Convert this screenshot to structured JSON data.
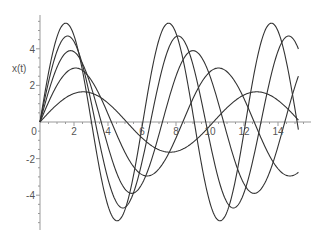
{
  "chart_data": {
    "type": "line",
    "title": "",
    "xlabel": "",
    "ylabel": "x(t)",
    "xlim": [
      0,
      15.5
    ],
    "ylim": [
      -5.9,
      5.8
    ],
    "grid": false,
    "legend": null,
    "xticks": [
      0,
      2,
      4,
      6,
      8,
      10,
      12,
      14
    ],
    "xtick_labels": [
      "0",
      "2",
      "4",
      "6",
      "8",
      "10",
      "12",
      "14"
    ],
    "yticks": [
      -4,
      -2,
      2,
      4
    ],
    "ytick_labels": [
      "-4",
      "-2",
      "2",
      "4"
    ],
    "x": [
      0,
      0.5,
      1,
      1.5,
      2,
      2.5,
      3,
      3.5,
      4,
      4.5,
      5,
      5.5,
      6,
      6.5,
      7,
      7.5,
      8,
      8.5,
      9,
      9.5,
      10,
      10.5,
      11,
      11.5,
      12,
      12.5,
      13,
      13.5,
      14,
      14.5,
      15,
      15.2
    ],
    "series": [
      {
        "name": "curve-1",
        "amplitude": 5.4,
        "period": 6.05,
        "values": [
          0,
          2.64,
          4.67,
          5.4,
          4.78,
          3.08,
          0.55,
          -2.09,
          -4.3,
          -5.33,
          -5.03,
          -3.45,
          -0.96,
          1.66,
          3.96,
          5.19,
          5.22,
          3.99,
          1.55,
          -1.09,
          -3.52,
          -4.98,
          -5.31,
          -4.28,
          -1.95,
          0.65,
          3.14,
          4.88,
          5.4,
          4.73,
          2.74,
          1.63
        ]
      },
      {
        "name": "curve-2",
        "amplitude": 4.7,
        "period": 6.5,
        "values": [
          0,
          2.13,
          3.79,
          4.67,
          4.31,
          2.96,
          0.98,
          -1.27,
          -3.2,
          -4.47,
          -4.66,
          -3.7,
          -1.79,
          0.5,
          2.56,
          4.07,
          4.67,
          4.2,
          2.81,
          0.73,
          -1.52,
          -3.4,
          -4.55,
          -4.64,
          -3.58,
          -1.56,
          0.73,
          2.84,
          4.23,
          4.66,
          4.08,
          3.49
        ]
      },
      {
        "name": "curve-3",
        "amplitude": 3.9,
        "period": 7.2,
        "values": [
          0,
          1.65,
          3.0,
          3.79,
          3.84,
          3.14,
          1.89,
          0.34,
          -1.35,
          -2.76,
          -3.66,
          -3.88,
          -3.38,
          -2.21,
          -0.68,
          0.98,
          2.47,
          3.5,
          3.9,
          3.58,
          2.5,
          1.03,
          -0.68,
          -2.19,
          -3.32,
          -3.85,
          -3.71,
          -2.94,
          -1.55,
          0.1,
          1.78,
          2.46
        ]
      },
      {
        "name": "curve-4",
        "amplitude": 2.95,
        "period": 8.4,
        "values": [
          0,
          1.07,
          1.98,
          2.64,
          2.94,
          2.84,
          2.35,
          1.55,
          0.55,
          -0.53,
          -1.54,
          -2.34,
          -2.84,
          -2.95,
          -2.64,
          -1.98,
          -1.08,
          -0.01,
          1.05,
          1.97,
          2.63,
          2.94,
          2.86,
          2.4,
          1.58,
          0.58,
          -0.5,
          -1.52,
          -2.33,
          -2.85,
          -2.94,
          -2.9
        ]
      },
      {
        "name": "curve-5",
        "amplitude": 1.65,
        "period": 10.2,
        "values": [
          0,
          0.5,
          0.95,
          1.3,
          1.54,
          1.65,
          1.62,
          1.44,
          1.13,
          0.73,
          0.25,
          -0.25,
          -0.73,
          -1.13,
          -1.44,
          -1.61,
          -1.65,
          -1.55,
          -1.33,
          -0.99,
          -0.56,
          -0.08,
          0.41,
          0.88,
          1.26,
          1.53,
          1.65,
          1.63,
          1.47,
          1.19,
          0.79,
          0.62
        ]
      }
    ],
    "line_color": "#333333",
    "axis_color": "#999999"
  }
}
